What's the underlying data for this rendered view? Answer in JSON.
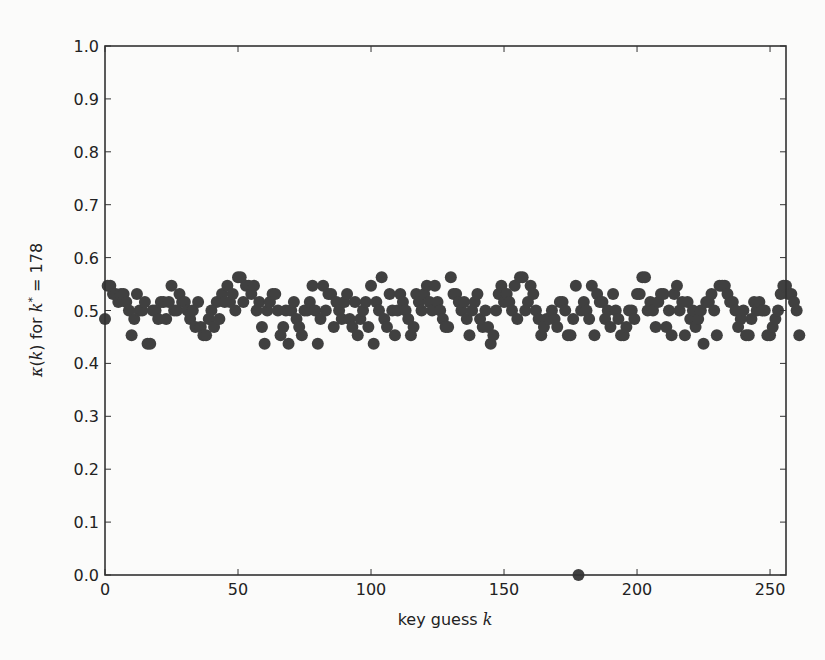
{
  "chart_data": {
    "type": "scatter",
    "title": "",
    "xlabel": "key guess k",
    "ylabel": "κ(k) for k* = 178",
    "xlim": [
      0,
      256
    ],
    "ylim": [
      0.0,
      1.0
    ],
    "xticks": [
      0,
      50,
      100,
      150,
      200,
      250
    ],
    "yticks": [
      0.0,
      0.1,
      0.2,
      0.3,
      0.4,
      0.5,
      0.6,
      0.7,
      0.8,
      0.9,
      1.0
    ],
    "grid": false,
    "marker_color": "#404040",
    "correct_key": 178,
    "correct_key_value": 0.0,
    "series": [
      {
        "name": "kappa",
        "x_start": 0,
        "values": [
          0.484,
          0.547,
          0.547,
          0.531,
          0.531,
          0.516,
          0.531,
          0.531,
          0.516,
          0.5,
          0.453,
          0.484,
          0.531,
          0.5,
          0.5,
          0.516,
          0.437,
          0.437,
          0.5,
          0.5,
          0.484,
          0.516,
          0.516,
          0.484,
          0.516,
          0.547,
          0.5,
          0.5,
          0.531,
          0.516,
          0.516,
          0.5,
          0.484,
          0.5,
          0.469,
          0.516,
          0.469,
          0.453,
          0.453,
          0.484,
          0.5,
          0.469,
          0.516,
          0.484,
          0.531,
          0.516,
          0.547,
          0.516,
          0.531,
          0.5,
          0.563,
          0.563,
          0.516,
          0.547,
          0.547,
          0.531,
          0.547,
          0.5,
          0.516,
          0.469,
          0.437,
          0.5,
          0.516,
          0.531,
          0.531,
          0.5,
          0.453,
          0.469,
          0.5,
          0.437,
          0.5,
          0.516,
          0.484,
          0.469,
          0.453,
          0.5,
          0.5,
          0.516,
          0.547,
          0.5,
          0.437,
          0.484,
          0.547,
          0.5,
          0.531,
          0.531,
          0.469,
          0.516,
          0.5,
          0.484,
          0.516,
          0.531,
          0.484,
          0.469,
          0.516,
          0.453,
          0.484,
          0.5,
          0.516,
          0.469,
          0.547,
          0.437,
          0.516,
          0.5,
          0.563,
          0.484,
          0.469,
          0.531,
          0.5,
          0.453,
          0.5,
          0.531,
          0.516,
          0.5,
          0.484,
          0.453,
          0.469,
          0.531,
          0.516,
          0.5,
          0.531,
          0.547,
          0.516,
          0.5,
          0.547,
          0.516,
          0.5,
          0.484,
          0.469,
          0.469,
          0.563,
          0.531,
          0.531,
          0.516,
          0.5,
          0.516,
          0.484,
          0.453,
          0.5,
          0.516,
          0.531,
          0.484,
          0.469,
          0.5,
          0.469,
          0.437,
          0.453,
          0.5,
          0.531,
          0.547,
          0.516,
          0.531,
          0.516,
          0.5,
          0.547,
          0.484,
          0.563,
          0.563,
          0.5,
          0.516,
          0.547,
          0.531,
          0.5,
          0.484,
          0.453,
          0.469,
          0.484,
          0.484,
          0.5,
          0.484,
          0.469,
          0.516,
          0.516,
          0.5,
          0.453,
          0.453,
          0.484,
          0.547,
          0.0,
          0.5,
          0.516,
          0.5,
          0.484,
          0.547,
          0.453,
          0.531,
          0.516,
          0.516,
          0.484,
          0.5,
          0.469,
          0.531,
          0.5,
          0.484,
          0.453,
          0.453,
          0.469,
          0.5,
          0.5,
          0.484,
          0.531,
          0.531,
          0.563,
          0.563,
          0.5,
          0.516,
          0.5,
          0.469,
          0.516,
          0.531,
          0.531,
          0.469,
          0.5,
          0.453,
          0.531,
          0.547,
          0.5,
          0.516,
          0.453,
          0.516,
          0.484,
          0.5,
          0.469,
          0.484,
          0.5,
          0.437,
          0.516,
          0.516,
          0.531,
          0.5,
          0.453,
          0.547,
          0.547,
          0.547,
          0.531,
          0.516,
          0.516,
          0.5,
          0.469,
          0.484,
          0.5,
          0.453,
          0.453,
          0.484,
          0.516,
          0.5,
          0.516,
          0.5,
          0.5,
          0.453,
          0.453,
          0.469,
          0.484,
          0.5,
          0.531,
          0.547,
          0.547,
          0.531,
          0.531,
          0.516,
          0.5,
          0.453
        ]
      }
    ]
  }
}
